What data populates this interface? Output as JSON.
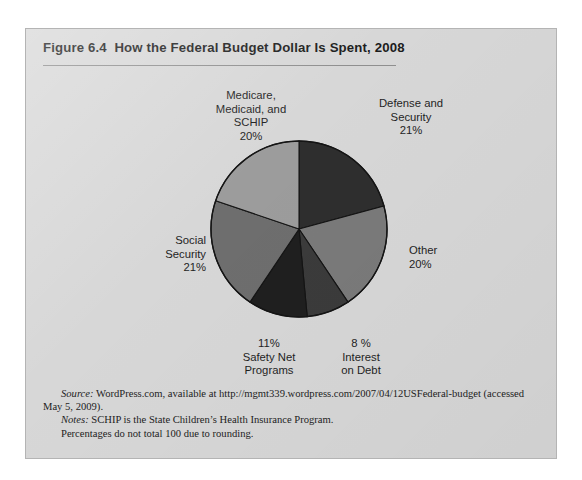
{
  "figure": {
    "title": "Figure 6.4  How the Federal Budget Dollar Is Spent, 2008",
    "frame_color": "#d7d7d7",
    "border_color": "#b4b4b4"
  },
  "labels": {
    "medicare": "Medicare,\nMedicaid, and\nSCHIP\n20%",
    "defense": "Defense and\nSecurity\n21%",
    "other": "Other\n20%",
    "interest": "8 %\nInterest\non Debt",
    "safety_net": "11%\nSafety Net\nPrograms",
    "social_security": "Social\nSecurity\n21%"
  },
  "footnotes": {
    "source_lead": "Source:",
    "source_text": " WordPress.com, available at http://mgmt339.wordpress.com/2007/04/12USFederal-budget (accessed May 5, 2009).",
    "notes_lead": "Notes:",
    "notes_text": " SCHIP is the State Children’s Health Insurance Program.",
    "notes_line2": "Percentages do not total 100 due to rounding."
  },
  "chart_data": {
    "type": "pie",
    "title": "How the Federal Budget Dollar Is Spent, 2008",
    "unit": "percent",
    "start_angle_deg": 0,
    "direction": "clockwise",
    "center": [
      298,
      228
    ],
    "radius": 88,
    "legend": "none (direct labels)",
    "grid": false,
    "categories": [
      "Defense and Security",
      "Other",
      "Interest on Debt",
      "Safety Net Programs",
      "Social Security",
      "Medicare, Medicaid, and SCHIP"
    ],
    "values": [
      21,
      20,
      8,
      11,
      21,
      20
    ],
    "value_labels": [
      "21%",
      "20%",
      "8 %",
      "11%",
      "21%",
      "20%"
    ],
    "colors": [
      "#2e2e2e",
      "#7a7a7a",
      "#3b3b3b",
      "#1f1f1f",
      "#6e6e6e",
      "#9c9c9c"
    ],
    "slice_edge_color": "#141414",
    "total": 101,
    "note": "Percentages do not total 100 due to rounding."
  }
}
